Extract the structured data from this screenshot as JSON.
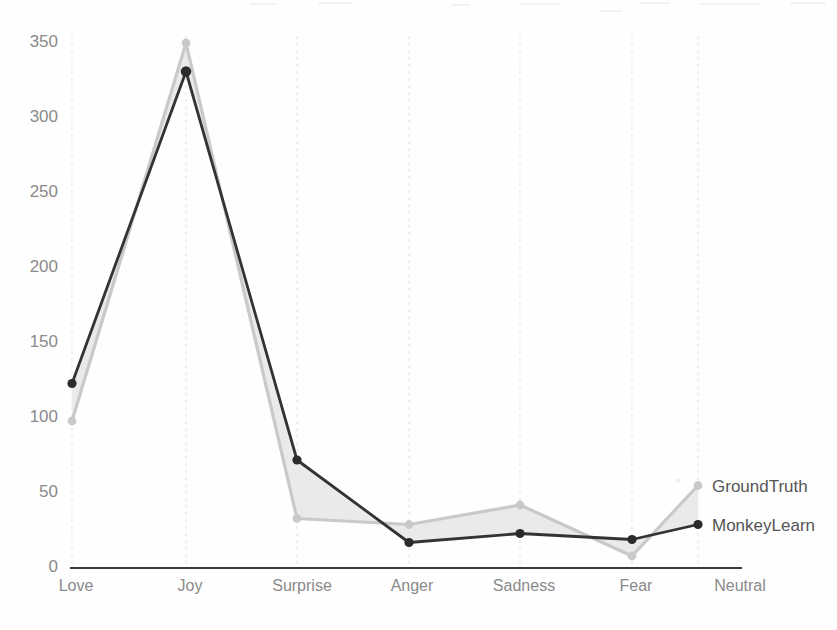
{
  "chart_data": {
    "type": "line",
    "title": "",
    "subtitle": "",
    "xlabel": "",
    "ylabel": "",
    "categories": [
      "Love",
      "Joy",
      "Surprise",
      "Anger",
      "Sadness",
      "Fear",
      "Neutral"
    ],
    "series": [
      {
        "name": "GroundTruth",
        "color": "#c9c9c9",
        "marker": "circle",
        "values": [
          98,
          350,
          33,
          29,
          42,
          8,
          55
        ]
      },
      {
        "name": "MonkeyLearn",
        "color": "#333333",
        "marker": "circle",
        "values": [
          123,
          331,
          72,
          17,
          23,
          19,
          29
        ]
      }
    ],
    "ylim": [
      0,
      350
    ],
    "yticks": [
      0,
      50,
      100,
      150,
      200,
      250,
      300,
      350
    ],
    "ytick_labels": [
      "0",
      "50",
      "100",
      "150",
      "200",
      "250",
      "300",
      "350"
    ],
    "xtick_labels": [
      "Love",
      "Joy",
      "Surprise",
      "Anger",
      "Sadness",
      "Fear",
      "Neutral"
    ],
    "grid": {
      "vertical": true,
      "horizontal": false,
      "style": "dashed",
      "color": "#e3e3e3"
    },
    "legend": {
      "position": "right-inline",
      "entries": [
        "GroundTruth",
        "MonkeyLearn"
      ]
    },
    "fill_between": {
      "enabled": true,
      "color": "#e8e8e8",
      "description": "shaded band between GroundTruth and MonkeyLearn"
    }
  },
  "legend": {
    "ground_truth": "GroundTruth",
    "monkey_learn": "MonkeyLearn"
  },
  "axes": {
    "y_ticks": [
      "350",
      "300",
      "250",
      "200",
      "150",
      "100",
      "50",
      "0"
    ],
    "x_ticks": [
      "Love",
      "Joy",
      "Surprise",
      "Anger",
      "Sadness",
      "Fear",
      "Neutral"
    ]
  },
  "colors": {
    "ground_truth": "#c9c9c9",
    "monkey_learn": "#333333",
    "grid": "#e3e3e3",
    "axis": "#3a3a3a",
    "tick_text": "#8a8a8a",
    "legend_text": "#555555",
    "background": "#fefefe"
  }
}
